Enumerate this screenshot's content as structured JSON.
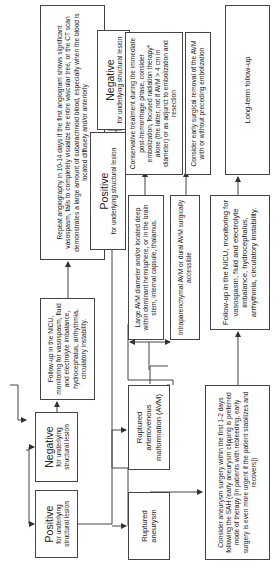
{
  "diagram": {
    "orientation": "rotated-90-ccw",
    "nodes": {
      "positive_initial": {
        "title": "Positive",
        "subtitle": "for underlying structural lesion"
      },
      "negative_initial": {
        "title": "Negative",
        "subtitle": "for underlying structural lesion"
      },
      "followup_nicu_small": {
        "text": "Follow-up in the NICU, monitoring for vasospasm, fluid and electrolyte imbalance, hydrocephalus, arrhythmia, circulatory instability."
      },
      "repeat_angiography": {
        "text": "Repeat angiography in 10-14 days if the first angiogram shows significant vasospasm, fails to completely visualize the entire vascular tree, or the CT scan demonstrates a large amount of subarachnoid blood, especially when the blood is located diffusely and/or anteriorly"
      },
      "positive_repeat": {
        "title": "Positive",
        "subtitle": "for underlying structural lesion"
      },
      "negative_repeat": {
        "title": "Negative",
        "subtitle": "for underlying structural lesion"
      },
      "ruptured_aneurysm": {
        "text": "Ruptured aneurysm"
      },
      "ruptured_avm": {
        "text": "Ruptured arteriovenous malformation (AVM)"
      },
      "large_avm": {
        "text": "Large AVM diameter and/or located deep within dominant hemisphere, or in the brain stem, internal capsule, thalamus."
      },
      "intraparenchymal_avm": {
        "text": "Intraparenchymal AVM or dural AVM surgically accessible"
      },
      "conservative_treatment": {
        "text": "Conservative treatment during the immediate post-hemorrhage phase, consider embolization, focused radiation therapy* alone (the latter, not if AVM > 4 cm in diameter) or as adjunct to embolization and resection"
      },
      "early_surgical_removal": {
        "text": "Consider early surgical removal of the AVM with or without preceding embolization"
      },
      "long_term_followup": {
        "text": "Long-term follow-up"
      },
      "followup_nicu_large": {
        "text": "Follow-up in the NICU, monitoring for vasospasm, fluid and electrolyte imbalance, hydrocephalus, arrhythmia, circulatory instability."
      },
      "aneurysm_surgery": {
        "text": "Consider aneurysm surgery within the first 1-2 days following the SAH (early aneurysm clipping is preferred mode of therapy [in patients with rebleeding, early surgery is even more urgent if the patient stabilizes and recovers])"
      }
    },
    "colors": {
      "line": "#444444",
      "text": "#222222",
      "background": "#ffffff"
    }
  }
}
